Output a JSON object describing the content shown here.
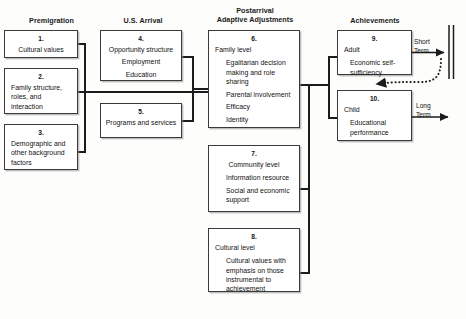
{
  "diagram": {
    "columns": [
      {
        "id": "premigration",
        "header": "Premigration"
      },
      {
        "id": "us-arrival",
        "header": "U.S. Arrival"
      },
      {
        "id": "postarrival",
        "header_line1": "Postarrival",
        "header_line2": "Adaptive Adjustments"
      },
      {
        "id": "achievements",
        "header": "Achievements"
      }
    ],
    "boxes": [
      {
        "num": "1.",
        "title": "Cultural values",
        "title_align": "center",
        "items": []
      },
      {
        "num": "2.",
        "title": "Family structure, roles, and interaction",
        "title_align": "left",
        "items": []
      },
      {
        "num": "3.",
        "title": "Demographic and other background factors",
        "title_align": "left",
        "items": []
      },
      {
        "num": "4.",
        "title": "Opportunity structure",
        "title_align": "center",
        "items": [
          "Employment",
          "Education"
        ]
      },
      {
        "num": "5.",
        "title": "Programs and services",
        "title_align": "center",
        "items": []
      },
      {
        "num": "6.",
        "title": "Family level",
        "title_align": "left",
        "items": [
          "Egalitarian decision making and role sharing",
          "Parental involvement",
          "Efficacy",
          "Identity"
        ]
      },
      {
        "num": "7.",
        "title": "Community level",
        "title_align": "left",
        "items": [
          "Information resource",
          "Social and economic support"
        ]
      },
      {
        "num": "8.",
        "title": "Cultural level",
        "title_align": "left",
        "items": [
          "Cultural values with emphasis on those instrumental to achievement"
        ]
      },
      {
        "num": "9.",
        "title": "Adult",
        "title_align": "left",
        "items": [
          "Economic self-sufficiency"
        ]
      },
      {
        "num": "10.",
        "title": "Child",
        "title_align": "left",
        "items": [
          "Educational performance"
        ]
      }
    ],
    "outcome_labels": [
      {
        "id": "short-term",
        "line1": "Short",
        "line2": "Term"
      },
      {
        "id": "long-term",
        "line1": "Long",
        "line2": "Term"
      }
    ],
    "colors": {
      "line": "#1c1c1c",
      "box_border": "#3a3a3a",
      "text": "#121212",
      "background": "#fdfdfc"
    }
  }
}
